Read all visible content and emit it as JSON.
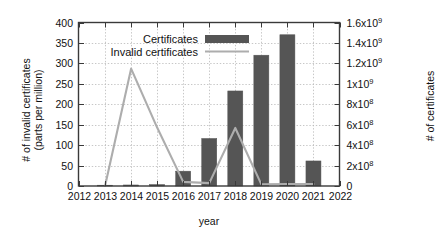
{
  "chart_data": {
    "type": "bar",
    "title": "",
    "xlabel": "year",
    "ylabel": "# of invalid certificates\n(parts per million)",
    "ylabel_right": "# of certificates",
    "categories": [
      "2012",
      "2013",
      "2014",
      "2015",
      "2016",
      "2017",
      "2018",
      "2019",
      "2020",
      "2021",
      "2022"
    ],
    "xlim": [
      2012,
      2022
    ],
    "ylim": [
      0,
      400
    ],
    "ylim_right": [
      0,
      1600000000
    ],
    "yticks": [
      "0",
      "50",
      "100",
      "150",
      "200",
      "250",
      "300",
      "350",
      "400"
    ],
    "ytick_values": [
      0,
      50,
      100,
      150,
      200,
      250,
      300,
      350,
      400
    ],
    "yticks_right": [
      "0",
      "2x10^8",
      "4x10^8",
      "6x10^8",
      "8x10^8",
      "1x10^9",
      "1.2x10^9",
      "1.4x10^9",
      "1.6x10^9"
    ],
    "ytick_right_mantissas": [
      "0",
      "2x10",
      "4x10",
      "6x10",
      "8x10",
      "1x10",
      "1.2x10",
      "1.4x10",
      "1.6x10"
    ],
    "ytick_right_exponents": [
      "",
      "8",
      "8",
      "8",
      "8",
      "9",
      "9",
      "9",
      "9"
    ],
    "ytick_right_values": [
      0,
      200000000,
      400000000,
      600000000,
      800000000,
      1000000000,
      1200000000,
      1400000000,
      1600000000
    ],
    "grid": true,
    "legend_position": "top-center",
    "series": [
      {
        "name": "Certificates",
        "kind": "bar",
        "axis": "right",
        "color": "#555555",
        "x": [
          "2013",
          "2014",
          "2015",
          "2016",
          "2017",
          "2018",
          "2019",
          "2020",
          "2021"
        ],
        "values": [
          2000000,
          10000000,
          14000000,
          145000000,
          465000000,
          930000000,
          1280000000,
          1480000000,
          245000000
        ]
      },
      {
        "name": "Invalid certificates",
        "kind": "line",
        "axis": "left",
        "color": "#adadad",
        "x": [
          "2013",
          "2014",
          "2015",
          "2016",
          "2017",
          "2018",
          "2019",
          "2020",
          "2021"
        ],
        "values": [
          0,
          287,
          143,
          10,
          7,
          142,
          4,
          5,
          5
        ]
      }
    ]
  },
  "legend": {
    "entries": [
      {
        "label": "Certificates",
        "marker": "bar-swatch",
        "color": "#555555"
      },
      {
        "label": "Invalid certificates",
        "marker": "line-swatch",
        "color": "#adadad"
      }
    ]
  },
  "colors": {
    "bar": "#555555",
    "line": "#adadad",
    "axis": "#3a3a3a",
    "grid": "#b9b9b9",
    "background": "#ffffff",
    "text": "#111111"
  }
}
